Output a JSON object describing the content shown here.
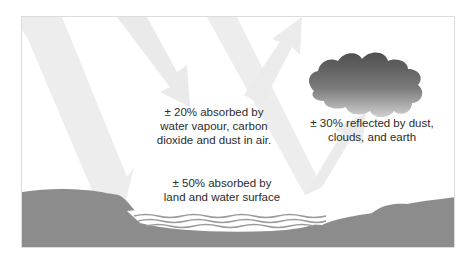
{
  "diagram": {
    "topic": "Solar radiation budget",
    "labels": {
      "air_absorption": {
        "lines": [
          "± 20% absorbed by",
          "water vapour, carbon",
          "dioxide and dust in air."
        ],
        "percent": "20%"
      },
      "reflection": {
        "lines": [
          "± 30% reflected by dust,",
          "clouds, and earth"
        ],
        "percent": "30%"
      },
      "surface_absorption": {
        "lines": [
          "± 50% absorbed by",
          "land and water surface"
        ],
        "percent": "50%"
      }
    },
    "elements": {
      "incoming_arrows": 3,
      "reflected_arrows": 2,
      "cloud": "dark gradient cloud",
      "ground": "land with water body"
    },
    "colors": {
      "arrow": "#ececec",
      "ground": "#8c8c8c",
      "cloud_top": "#555555",
      "cloud_bottom": "#c4c4c4",
      "text": "#2b2b2b",
      "water_lines": "#ffffff"
    }
  }
}
